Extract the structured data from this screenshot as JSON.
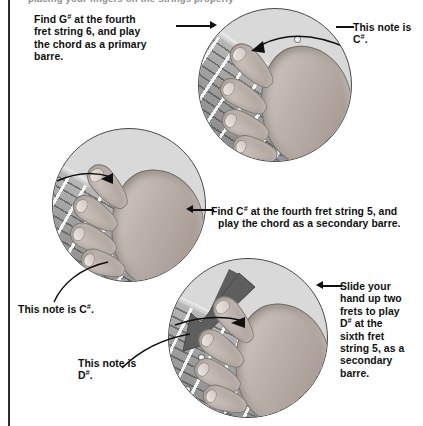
{
  "page": {
    "top_clipped_line": "placing your fingers on the strings properly"
  },
  "colors": {
    "text": "#101010",
    "rule": "#2b2b2b",
    "photo_border": "#4a4a4a",
    "photo_bg": "#d9d9d9",
    "slide_arrow": "#5e5e5e"
  },
  "callouts": [
    {
      "id": "find-g-sharp",
      "lines": [
        "Find G<sup>#</sup> at the fourth",
        "fret string 6, and play",
        "the chord as a primary",
        "barre."
      ],
      "plain": "Find G# at the fourth fret string 6, and play the chord as a primary barre."
    },
    {
      "id": "this-note-is-c-sharp-top",
      "lines": [
        "This note is",
        "C<sup>#</sup>."
      ],
      "plain": "This note is C#."
    },
    {
      "id": "find-c-sharp",
      "lines": [
        "Find C<sup>#</sup> at the fourth fret string 5, and",
        "play the chord as a secondary barre."
      ],
      "plain": "Find C# at the fourth fret string 5, and play the chord as a secondary barre."
    },
    {
      "id": "this-note-is-c-sharp-left",
      "lines": [
        "This note is C<sup>#</sup>."
      ],
      "plain": "This note is C#."
    },
    {
      "id": "this-note-is-d-sharp",
      "lines": [
        "This note is",
        "D<sup>#</sup>."
      ],
      "plain": "This note is D#."
    },
    {
      "id": "slide-your-hand",
      "lines": [
        "Slide your",
        "hand up two",
        "frets to play",
        "D<sup>#</sup> at the",
        "sixth fret",
        "string 5, as a",
        "secondary",
        "barre."
      ],
      "plain": "Slide your hand up two frets to play D# at the sixth fret string 5, as a secondary barre."
    }
  ],
  "photos": [
    {
      "id": "photo-primary-barre",
      "caption": "Hand playing a primary barre chord at the fourth fret, string 6"
    },
    {
      "id": "photo-secondary-barre",
      "caption": "Hand playing a secondary barre chord at the fourth fret, string 5"
    },
    {
      "id": "photo-slide-up",
      "caption": "Hand sliding up two frets to the sixth fret, string 5, with a slide direction arrow"
    }
  ]
}
